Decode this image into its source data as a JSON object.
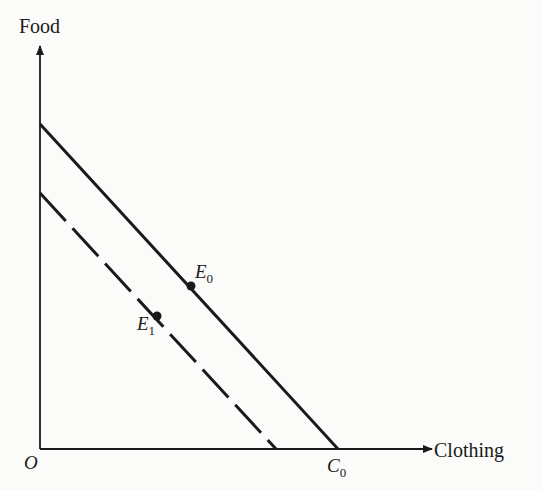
{
  "diagram": {
    "y_axis_label": "Food",
    "x_axis_label": "Clothing",
    "origin_label": "O",
    "x_intercept_label": {
      "main": "C",
      "sub": "0"
    },
    "points": [
      {
        "main": "E",
        "sub": "0"
      },
      {
        "main": "E",
        "sub": "1"
      }
    ],
    "lines": [
      {
        "name": "original-budget-line",
        "style": "solid"
      },
      {
        "name": "shifted-budget-line",
        "style": "dashed"
      }
    ],
    "colors": {
      "ink": "#1a1a1a",
      "background": "#fbfbf9"
    }
  }
}
